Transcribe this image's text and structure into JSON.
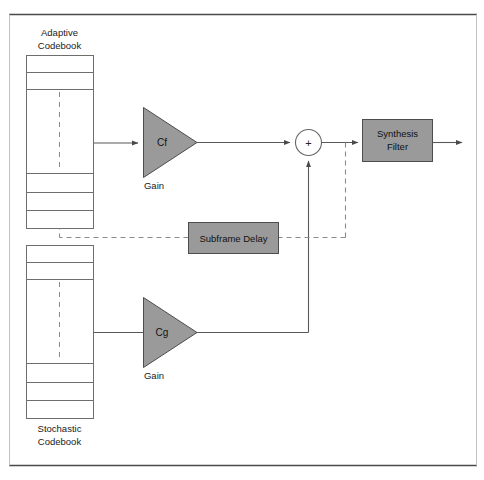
{
  "figure": {
    "type": "block-diagram",
    "title_visible": false,
    "background_color": "#ffffff",
    "frame": {
      "top_rule_color": "#4a4a4a",
      "bottom_rule_color": "#4a4a4a",
      "side_rule_color": "#b8b8b8"
    }
  },
  "colors": {
    "block_fill": "#9a9a9a",
    "block_stroke": "#4d4d4d",
    "line": "#595959",
    "dashed_line": "#8a8a8a",
    "table_stroke": "#6e6e6e",
    "text": "#1a1a1a"
  },
  "labels": {
    "adaptive_codebook_line1": "Adaptive",
    "adaptive_codebook_line2": "Codebook",
    "stochastic_codebook_line1": "Stochastic",
    "stochastic_codebook_line2": "Codebook",
    "gain_cf": "Cf",
    "gain_cf_caption": "Gain",
    "gain_cg": "Cg",
    "gain_cg_caption": "Gain",
    "adder_symbol": "+",
    "subframe_delay": "Subframe Delay",
    "synthesis_filter_line1": "Synthesis",
    "synthesis_filter_line2": "Filter"
  },
  "blocks": [
    {
      "name": "adaptive-codebook",
      "kind": "table",
      "x": 26,
      "y": 55,
      "width": 67,
      "height": 173,
      "row_dividers_y": [
        72,
        89,
        173,
        192,
        210
      ],
      "dashed_center_x": 59,
      "dashed_from_y": 89,
      "dashed_to_y": 173
    },
    {
      "name": "stochastic-codebook",
      "kind": "table",
      "x": 26,
      "y": 245,
      "width": 67,
      "height": 173,
      "row_dividers_y": [
        262,
        279,
        363,
        382,
        400
      ],
      "dashed_center_x": 59,
      "dashed_from_y": 279,
      "dashed_to_y": 363
    },
    {
      "name": "gain-cf-triangle",
      "kind": "triangle",
      "x": 143,
      "y": 107,
      "width": 54,
      "height": 70
    },
    {
      "name": "gain-cg-triangle",
      "kind": "triangle",
      "x": 143,
      "y": 297,
      "width": 54,
      "height": 70
    },
    {
      "name": "adder",
      "kind": "circle",
      "cx": 308,
      "cy": 143,
      "r": 13
    },
    {
      "name": "subframe-delay",
      "kind": "rect",
      "x": 188,
      "y": 222,
      "width": 90,
      "height": 31
    },
    {
      "name": "synthesis-filter",
      "kind": "rect",
      "x": 362,
      "y": 119,
      "width": 70,
      "height": 42
    }
  ],
  "connections": [
    {
      "name": "adaptive-to-cf",
      "style": "solid",
      "arrow": true,
      "from": "adaptive-codebook",
      "to": "gain-cf-triangle"
    },
    {
      "name": "cf-to-adder",
      "style": "solid",
      "arrow": true,
      "from": "gain-cf-triangle",
      "to": "adder"
    },
    {
      "name": "stochastic-to-cg",
      "style": "solid",
      "arrow": false,
      "from": "stochastic-codebook",
      "to": "gain-cg-triangle"
    },
    {
      "name": "cg-to-adder",
      "style": "solid",
      "arrow": true,
      "from": "gain-cg-triangle",
      "to": "adder"
    },
    {
      "name": "adder-to-synthesis",
      "style": "solid",
      "arrow": true,
      "from": "adder",
      "to": "synthesis-filter"
    },
    {
      "name": "synthesis-output",
      "style": "solid",
      "arrow": true,
      "from": "synthesis-filter",
      "to": "output"
    },
    {
      "name": "feedback-tap-to-subframe-delay",
      "style": "dashed",
      "arrow": false,
      "from": "adder-output",
      "to": "subframe-delay"
    },
    {
      "name": "subframe-delay-to-adaptive-codebook",
      "style": "dashed",
      "arrow": false,
      "from": "subframe-delay",
      "to": "adaptive-codebook"
    }
  ]
}
